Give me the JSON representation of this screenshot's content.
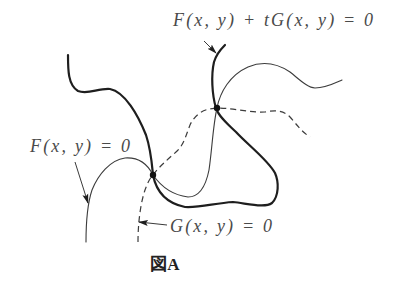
{
  "figure": {
    "caption": "図A"
  },
  "labels": {
    "combined_curve": "F(x, y) + tG(x, y) = 0",
    "f_curve": "F(x, y) = 0",
    "g_curve": "G(x, y) = 0"
  },
  "curves": [
    {
      "id": "F_plus_tG",
      "equation": "F(x, y) + tG(x, y) = 0",
      "style": "thick-solid"
    },
    {
      "id": "F",
      "equation": "F(x, y) = 0",
      "style": "thin-solid"
    },
    {
      "id": "G",
      "equation": "G(x, y) = 0",
      "style": "dashed"
    }
  ],
  "intersection_points": 2,
  "colors": {
    "thick_curve": "#1e1e1e",
    "thin_curve": "#3c3c3c",
    "text": "#4a4a4a",
    "background": "#ffffff"
  }
}
